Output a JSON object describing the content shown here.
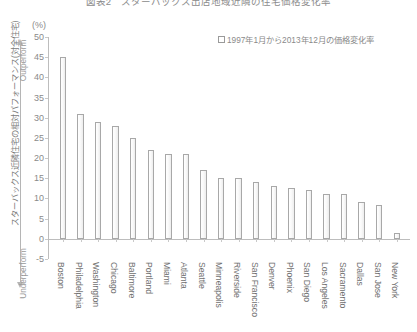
{
  "chart_title": "図表2　スターバックス出店地域近隣の住宅価格変化率",
  "unit_label": "(%)",
  "legend": {
    "label": "1997年1月から2013年12月の価格変化率",
    "marker": "open-square"
  },
  "vertical_axis_title": "スターバックス近隣住宅の相対パフォーマンス(対全住宅)",
  "performance_axis": {
    "top_label": "Outperform",
    "bottom_label": "Underperform"
  },
  "chart_data": {
    "type": "bar",
    "title": "図表2　スターバックス出店地域近隣の住宅価格変化率",
    "xlabel": "",
    "ylabel": "(%)",
    "ylim": [
      -5,
      50
    ],
    "ytick_step": 5,
    "yticks": [
      50,
      45,
      40,
      35,
      30,
      25,
      20,
      15,
      10,
      5,
      0,
      -5
    ],
    "grid": false,
    "legend_position": "top-right",
    "series_name": "1997年1月から2013年12月の価格変化率",
    "bar_fill": "#f5f5f5",
    "bar_border": "#a8a8a8",
    "categories": [
      "Boston",
      "Philadelphia",
      "Washington",
      "Chicago",
      "Baltimore",
      "Portland",
      "Miami",
      "Atlanta",
      "Seattle",
      "Minneapolis",
      "Riverside",
      "San Francisco",
      "Denver",
      "Phoenix",
      "San Diego",
      "Los Angeles",
      "Sacramento",
      "Dallas",
      "San Jose",
      "New York"
    ],
    "values": [
      45,
      31,
      29,
      28,
      25,
      22,
      21,
      21,
      17,
      15,
      15,
      14,
      13,
      12.5,
      12,
      11,
      11,
      9,
      8.5,
      1.5
    ]
  }
}
